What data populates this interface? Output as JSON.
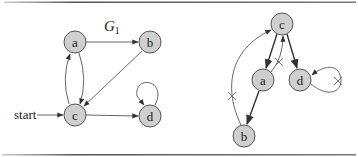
{
  "figure": {
    "left_graph": {
      "title": "G",
      "title_subscript": "1",
      "start_label": "start",
      "nodes": [
        {
          "id": "a",
          "label": "a"
        },
        {
          "id": "b",
          "label": "b"
        },
        {
          "id": "c",
          "label": "c"
        },
        {
          "id": "d",
          "label": "d"
        }
      ],
      "edges": [
        {
          "from": "a",
          "to": "b"
        },
        {
          "from": "b",
          "to": "c"
        },
        {
          "from": "a",
          "to": "c"
        },
        {
          "from": "c",
          "to": "a"
        },
        {
          "from": "c",
          "to": "d"
        },
        {
          "from": "d",
          "to": "d"
        },
        {
          "from": "start",
          "to": "c"
        }
      ]
    },
    "right_graph": {
      "nodes": [
        {
          "id": "c",
          "label": "c"
        },
        {
          "id": "a",
          "label": "a"
        },
        {
          "id": "d",
          "label": "d"
        },
        {
          "id": "b",
          "label": "b"
        }
      ],
      "tree_edges": [
        {
          "from": "c",
          "to": "a"
        },
        {
          "from": "c",
          "to": "d"
        },
        {
          "from": "a",
          "to": "b"
        }
      ],
      "crossed_edges": [
        {
          "from": "a",
          "to": "c"
        },
        {
          "from": "b",
          "to": "c"
        },
        {
          "from": "d",
          "to": "d"
        }
      ]
    },
    "colors": {
      "node_fill": "#cfcfcf",
      "node_stroke": "#555555",
      "edge": "#555555",
      "border": "#666666"
    }
  }
}
